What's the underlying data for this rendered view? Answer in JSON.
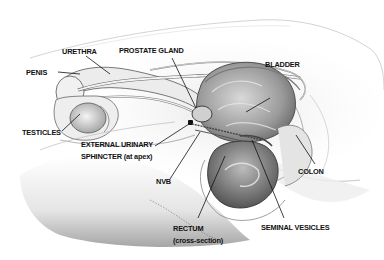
{
  "figure": {
    "type": "anatomical-illustration",
    "colors": {
      "background": "#ffffff",
      "ink": "#111111",
      "shading": "#8a8a8a",
      "light_shading": "#d4d4d4"
    },
    "labels": {
      "urethra": "URETHRA",
      "prostate_gland": "PROSTATE GLAND",
      "penis": "PENIS",
      "bladder": "BLADDER",
      "testicles": "TESTICLES",
      "external_sphincter_line1": "EXTERNAL URINARY",
      "external_sphincter_line2": "SPHINCTER (at apex)",
      "nvb": "NVB",
      "colon": "COLON",
      "rectum_line1": "RECTUM",
      "rectum_line2": "(cross-section)",
      "seminal_vesicles": "SEMINAL VESICLES"
    }
  }
}
